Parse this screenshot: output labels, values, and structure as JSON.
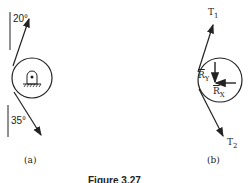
{
  "figure": {
    "caption": "Figure 3.27",
    "panel_a": {
      "label": "(a)",
      "angle_top": "20°",
      "angle_bottom": "35°",
      "support": "pin-support"
    },
    "panel_b": {
      "label": "(b)",
      "t1": {
        "main": "T",
        "sub": "1"
      },
      "t2": {
        "main": "T",
        "sub": "2"
      },
      "ry": {
        "main": "R",
        "sub": "Y"
      },
      "rx": {
        "main": "R",
        "sub": "X"
      }
    },
    "colors": {
      "ink": "#222222",
      "background": "#ffffff"
    }
  }
}
